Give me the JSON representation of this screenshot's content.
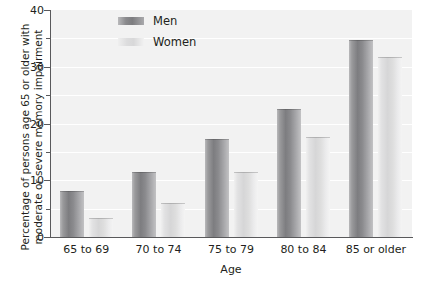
{
  "chart_data": {
    "type": "bar",
    "title": "",
    "subtitle": "",
    "xlabel": "Age",
    "ylabel": "Percentage of persons age 65 or older with moderate or severe memory impairment",
    "ylabel_line1": "Percentage of persons age 65 or older with",
    "ylabel_line2": "moderate or severe memory impairment",
    "categories": [
      "65 to 69",
      "70 to 74",
      "75 to 79",
      "80 to 84",
      "85 or older"
    ],
    "series": [
      {
        "name": "Men",
        "values": [
          7.9,
          11.2,
          17.1,
          22.3,
          34.5
        ],
        "color": "#808083"
      },
      {
        "name": "Women",
        "values": [
          3.2,
          5.8,
          11.3,
          17.5,
          31.5
        ],
        "color": "#dcdcdd"
      }
    ],
    "ylim": [
      0,
      40
    ],
    "y_major_ticks": [
      0,
      10,
      20,
      30,
      40
    ],
    "y_major_tick_labels": [
      "0",
      "10",
      "20",
      "30",
      "40"
    ],
    "y_minor_ticks": [
      5,
      15,
      25,
      35
    ],
    "grid": true,
    "grid_color": "#ffffff",
    "plot_background": "#f2f2f2",
    "legend_position": "top-left-inside",
    "legend_entries": [
      "Men",
      "Women"
    ]
  },
  "axis": {
    "y_labels": [
      "40",
      "30",
      "20",
      "10",
      "0"
    ],
    "x_title": "Age"
  },
  "legend": {
    "items": [
      {
        "label": "Men"
      },
      {
        "label": "Women"
      }
    ]
  }
}
